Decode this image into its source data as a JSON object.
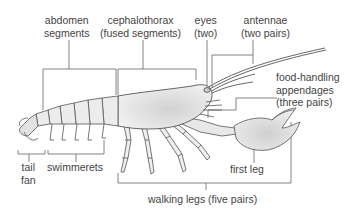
{
  "diagram": {
    "colors": {
      "line": "#555555",
      "body_fill": "#e4e4e4",
      "body_shade": "#bdbdbd",
      "text": "#444444",
      "background": "#ffffff"
    },
    "labels": {
      "abdomen": {
        "line1": "abdomen",
        "line2": "segments"
      },
      "cephalothorax": {
        "line1": "cephalothorax",
        "line2": "(fused segments)"
      },
      "eyes": {
        "line1": "eyes",
        "line2": "(two)"
      },
      "antennae": {
        "line1": "antennae",
        "line2": "(two pairs)"
      },
      "food_handling": {
        "line1": "food-handling",
        "line2": "appendages",
        "line3": "(three pairs)"
      },
      "tail_fan": {
        "line1": "tail",
        "line2": "fan"
      },
      "swimmerets": {
        "line1": "swimmerets"
      },
      "first_leg": {
        "line1": "first leg"
      },
      "walking_legs": {
        "line1": "walking legs (five pairs)"
      }
    }
  }
}
